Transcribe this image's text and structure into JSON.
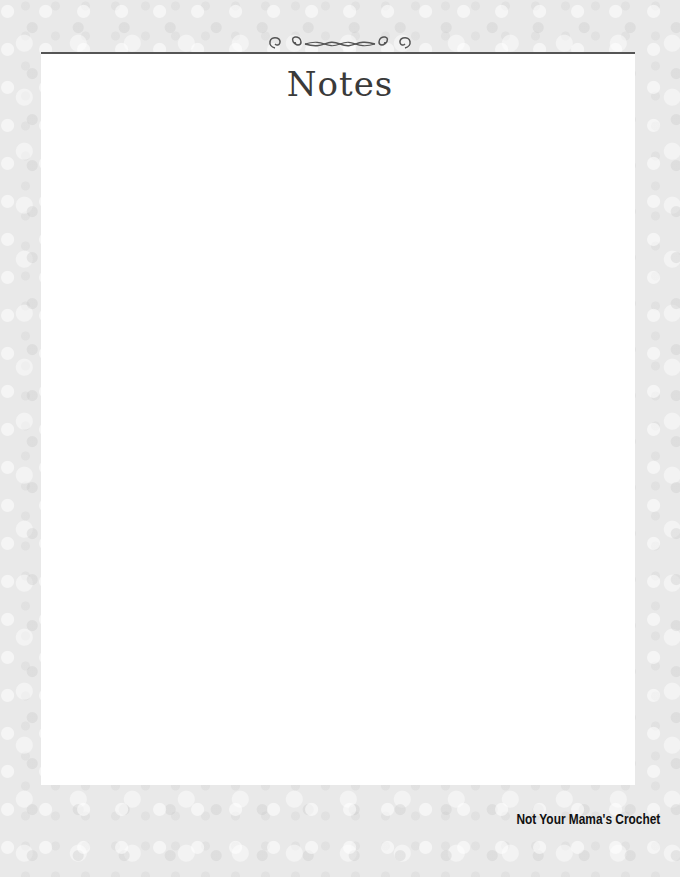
{
  "page": {
    "title": "Notes",
    "footer": "Not Your Mama's Crochet"
  },
  "colors": {
    "background": "#e9e9e9",
    "panel": "#ffffff",
    "rule": "#555555",
    "title": "#3a3a3a"
  }
}
